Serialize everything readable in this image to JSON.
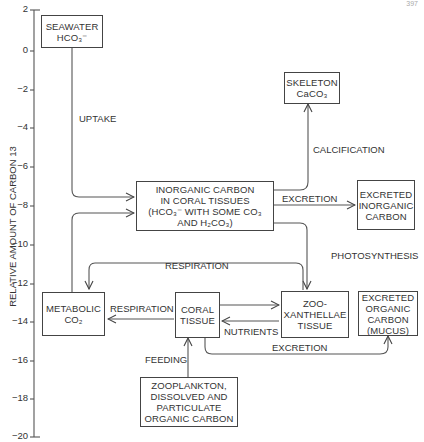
{
  "y_axis": {
    "label": "RELATIVE AMOUNT OF CARBON 13",
    "ticks": [
      "2",
      "0",
      "−2",
      "−4",
      "−6",
      "−8",
      "−10",
      "−12",
      "−14",
      "−16",
      "−18",
      "−20"
    ]
  },
  "corner_text": "397",
  "nodes": {
    "seawater": {
      "line1": "SEAWATER",
      "line2": "HCO₃⁻"
    },
    "skeleton": {
      "line1": "SKELETON",
      "line2": "CaCO₃"
    },
    "inorganic": {
      "line1": "INORGANIC CARBON",
      "line2": "IN CORAL TISSUES",
      "line3": "(HCO₃⁻ WITH SOME CO₃",
      "line4": "AND H₂CO₃)"
    },
    "excreted_inorganic": {
      "line1": "EXCRETED",
      "line2": "INORGANIC",
      "line3": "CARBON"
    },
    "metabolic": {
      "line1": "METABOLIC",
      "line2": "CO₂"
    },
    "coral_tissue": {
      "line1": "CORAL",
      "line2": "TISSUE"
    },
    "zooxanthellae": {
      "line1": "ZOO-",
      "line2": "XANTHELLAE",
      "line3": "TISSUE"
    },
    "excreted_organic": {
      "line1": "EXCRETED",
      "line2": "ORGANIC",
      "line3": "CARBON",
      "line4": "(MUCUS)"
    },
    "zooplankton": {
      "line1": "ZOOPLANKTON,",
      "line2": "DISSOLVED AND",
      "line3": "PARTICULATE",
      "line4": "ORGANIC CARBON"
    }
  },
  "edges": {
    "uptake": "UPTAKE",
    "calcification": "CALCIFICATION",
    "excretion_inorganic": "EXCRETION",
    "photosynthesis": "PHOTOSYNTHESIS",
    "respiration_top": "RESPIRATION",
    "respiration_left": "RESPIRATION",
    "nutrients": "NUTRIENTS",
    "excretion_organic": "EXCRETION",
    "feeding": "FEEDING"
  }
}
